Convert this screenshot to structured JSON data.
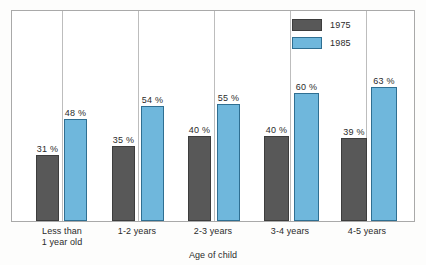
{
  "chart_data": {
    "type": "bar",
    "title": "",
    "xlabel": "Age of child",
    "ylabel": "",
    "ylim": [
      0,
      100
    ],
    "grid": false,
    "legend_position": "top-right",
    "categories": [
      "Less than\n1 year old",
      "1-2 years",
      "2-3 years",
      "3-4 years",
      "4-5 years"
    ],
    "category_lines": [
      [
        "Less than",
        "1 year old"
      ],
      [
        "1-2 years"
      ],
      [
        "2-3 years"
      ],
      [
        "3-4 years"
      ],
      [
        "4-5 years"
      ]
    ],
    "series": [
      {
        "name": "1975",
        "color": "#585858",
        "values": [
          31,
          35,
          40,
          40,
          39
        ],
        "labels": [
          "31 %",
          "35 %",
          "40 %",
          "40 %",
          "39 %"
        ]
      },
      {
        "name": "1985",
        "color": "#6fb7dc",
        "values": [
          48,
          54,
          55,
          60,
          63
        ],
        "labels": [
          "48 %",
          "54 %",
          "55 %",
          "60 %",
          "63 %"
        ]
      }
    ]
  },
  "legend": {
    "items": [
      {
        "label": "1975",
        "swatch": "dark-gray"
      },
      {
        "label": "1985",
        "swatch": "light-blue"
      }
    ]
  },
  "axis": {
    "x_title": "Age of child"
  },
  "colors": {
    "series_1975": "#585858",
    "series_1975_border": "#3d3d3d",
    "series_1985": "#6fb7dc",
    "series_1985_border": "#2f6f92",
    "frame": "#a9a9a9",
    "separator": "#bdbdbd",
    "text": "#2b2b2b"
  }
}
